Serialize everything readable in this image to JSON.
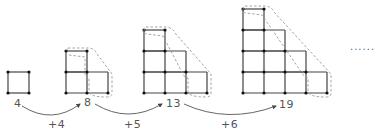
{
  "figures": [
    {
      "label": "4",
      "rows": [
        1
      ],
      "highlight": false
    },
    {
      "label": "8",
      "rows": [
        1,
        2
      ],
      "highlight": true
    },
    {
      "label": "13",
      "rows": [
        1,
        2,
        3
      ],
      "highlight": true
    },
    {
      "label": "19",
      "rows": [
        1,
        2,
        3,
        4
      ],
      "highlight": true
    }
  ],
  "increments": [
    "+4",
    "+5",
    "+6"
  ],
  "continuation": "......",
  "colors": {
    "line": "#444444",
    "node": "#111111",
    "dashed": "#999999",
    "text": "#555555"
  }
}
